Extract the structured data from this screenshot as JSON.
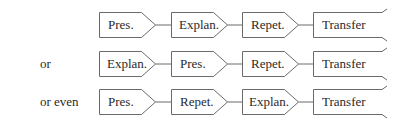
{
  "diagram": {
    "rows": [
      {
        "label": "",
        "steps": [
          "Pres.",
          "Explan.",
          "Repet.",
          "Transfer"
        ]
      },
      {
        "label": "or",
        "steps": [
          "Explan.",
          "Pres.",
          "Repet.",
          "Transfer"
        ]
      },
      {
        "label": "or even",
        "steps": [
          "Pres.",
          "Repet.",
          "Explan.",
          "Transfer"
        ]
      }
    ],
    "colors": {
      "stroke": "#6a6a6a",
      "text": "#2a2a2a",
      "background": "#ffffff"
    }
  }
}
